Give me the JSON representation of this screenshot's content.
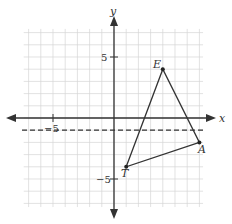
{
  "chart_data": {
    "type": "scatter",
    "title": "",
    "xlabel": "x",
    "ylabel": "y",
    "xlim": [
      -7,
      7
    ],
    "ylim": [
      -7,
      7
    ],
    "grid": true,
    "tick_labels": {
      "x": [
        "-5"
      ],
      "y": [
        "5",
        "-5"
      ]
    },
    "points": [
      {
        "label": "E",
        "x": 4,
        "y": 4
      },
      {
        "label": "A",
        "x": 7,
        "y": -2
      },
      {
        "label": "T",
        "x": 1,
        "y": -4
      }
    ],
    "polygon": [
      "T",
      "E",
      "A"
    ],
    "annotations": [
      {
        "type": "dashed-line",
        "equation": "y = -1"
      }
    ]
  },
  "labels": {
    "x_axis": "x",
    "y_axis": "y",
    "tick_x_neg5": "−5",
    "tick_y_5": "5",
    "tick_y_neg5": "−5",
    "E": "E",
    "A": "A",
    "T": "T"
  }
}
